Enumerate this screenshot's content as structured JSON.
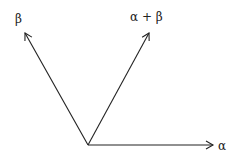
{
  "diagram": {
    "origin": {
      "x": 88,
      "y": 145
    },
    "vectors": [
      {
        "name": "beta",
        "label": "β",
        "tip": {
          "x": 25,
          "y": 33
        },
        "label_pos": {
          "x": 15,
          "y": 23
        }
      },
      {
        "name": "alpha-plus-beta",
        "label": "α + β",
        "tip": {
          "x": 149,
          "y": 33
        },
        "label_pos": {
          "x": 130,
          "y": 21
        }
      },
      {
        "name": "alpha",
        "label": "α",
        "tip": {
          "x": 213,
          "y": 145
        },
        "label_pos": {
          "x": 218,
          "y": 150
        }
      }
    ],
    "stroke_color": "#222222"
  }
}
